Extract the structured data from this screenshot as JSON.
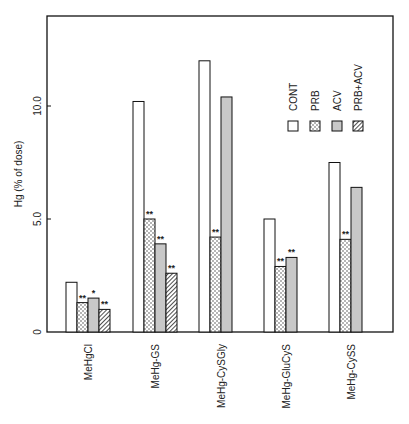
{
  "chart_data": {
    "type": "bar",
    "title": "",
    "xlabel": "",
    "ylabel": "Hg (% of dose)",
    "ylim": [
      0,
      13.5
    ],
    "yticks": [
      {
        "value": 0,
        "label": "0"
      },
      {
        "value": 5.0,
        "label": "5.0"
      },
      {
        "value": 10.0,
        "label": "10.0"
      }
    ],
    "grid": false,
    "legend_position": "top-right",
    "categories": [
      "MeHgCl",
      "MeHg-GS",
      "MeHg-CySGly",
      "MeHg-GluCyS",
      "MeHg-CySS"
    ],
    "series": [
      {
        "name": "CONT",
        "pattern": "open",
        "values": [
          2.2,
          10.2,
          12.0,
          5.0,
          7.5
        ],
        "significance": [
          "",
          "",
          "",
          "",
          ""
        ]
      },
      {
        "name": "PRB",
        "pattern": "dotted",
        "values": [
          1.3,
          5.0,
          4.2,
          2.9,
          4.1
        ],
        "significance": [
          "**",
          "**",
          "**",
          "**",
          "**"
        ]
      },
      {
        "name": "ACV",
        "pattern": "gray",
        "values": [
          1.5,
          3.9,
          10.4,
          3.3,
          6.4
        ],
        "significance": [
          "*",
          "**",
          "",
          "**",
          ""
        ]
      },
      {
        "name": "PRB+ACV",
        "pattern": "hatched",
        "values": [
          1.0,
          2.6,
          null,
          null,
          null
        ],
        "significance": [
          "**",
          "**",
          "",
          "",
          ""
        ]
      }
    ]
  }
}
